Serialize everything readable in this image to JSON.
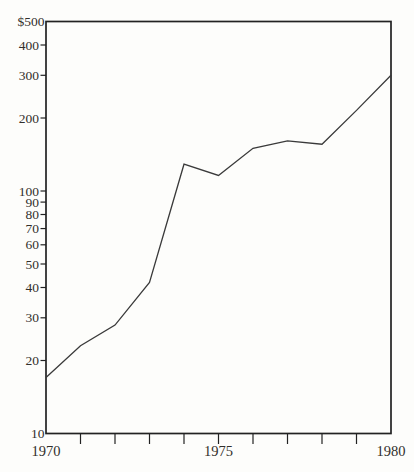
{
  "figure": {
    "background": "#fdfdfb",
    "axis_color": "#222222",
    "line_color": "#3a3a3a",
    "text_color": "#322f2b"
  },
  "chart_data": {
    "type": "line",
    "title": "",
    "xlabel": "",
    "ylabel": "",
    "y_scale": "log",
    "xlim": [
      1970,
      1980
    ],
    "ylim": [
      10,
      500
    ],
    "grid": false,
    "legend": false,
    "x": [
      1970,
      1971,
      1972,
      1973,
      1974,
      1975,
      1976,
      1977,
      1978,
      1979,
      1980
    ],
    "series": [
      {
        "name": "series-1",
        "values": [
          17,
          23,
          28,
          42,
          129,
          116,
          150,
          161,
          156,
          215,
          300
        ]
      }
    ],
    "y_ticks": [
      {
        "value": 500,
        "label": "$500"
      },
      {
        "value": 400,
        "label": "400"
      },
      {
        "value": 300,
        "label": "300"
      },
      {
        "value": 200,
        "label": "200"
      },
      {
        "value": 100,
        "label": "100"
      },
      {
        "value": 90,
        "label": "90"
      },
      {
        "value": 80,
        "label": "80"
      },
      {
        "value": 70,
        "label": "70"
      },
      {
        "value": 60,
        "label": "60"
      },
      {
        "value": 50,
        "label": "50"
      },
      {
        "value": 40,
        "label": "40"
      },
      {
        "value": 30,
        "label": "30"
      },
      {
        "value": 20,
        "label": "20"
      },
      {
        "value": 10,
        "label": "10"
      }
    ],
    "x_major_labels": [
      {
        "value": 1970,
        "label": "1970"
      },
      {
        "value": 1975,
        "label": "1975"
      },
      {
        "value": 1980,
        "label": "1980"
      }
    ],
    "x_minor_ticks": [
      1971,
      1972,
      1973,
      1974,
      1975,
      1976,
      1977,
      1978,
      1979
    ]
  }
}
